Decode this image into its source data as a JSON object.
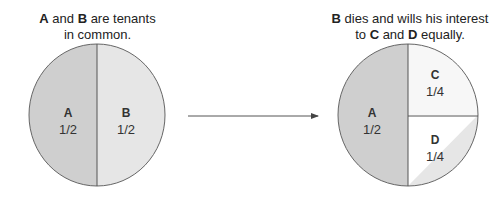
{
  "left": {
    "caption": {
      "p1": "A",
      "p2": " and ",
      "p3": "B",
      "p4": " are tenants",
      "line2": "in common."
    },
    "slices": [
      {
        "owner": "A",
        "share": "1/2",
        "color": "#cfcfcf"
      },
      {
        "owner": "B",
        "share": "1/2",
        "color": "#e6e6e6"
      }
    ]
  },
  "right": {
    "caption": {
      "p1": "B",
      "p2": " dies and wills his interest",
      "line2a": "to ",
      "line2b": "C",
      "line2c": " and ",
      "line2d": "D",
      "line2e": " equally."
    },
    "slices": [
      {
        "owner": "A",
        "share": "1/2",
        "color": "#cfcfcf"
      },
      {
        "owner": "C",
        "share": "1/4",
        "color": "#f7f7f7"
      },
      {
        "owner": "D",
        "share": "1/4",
        "color": "#e6e6e6"
      }
    ]
  },
  "arrow": {
    "color": "#555555"
  }
}
